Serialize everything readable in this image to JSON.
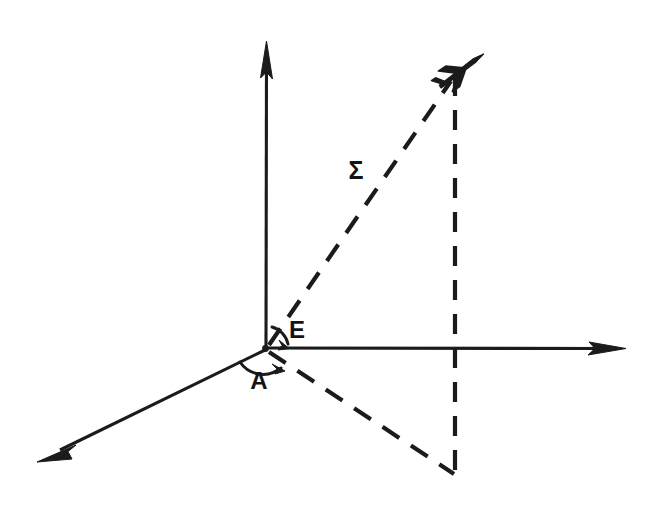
{
  "diagram": {
    "background_color": "#ffffff",
    "ink_color": "#1b1b1b",
    "canvas": {
      "width": 661,
      "height": 509
    },
    "origin": {
      "x": 265,
      "y": 349,
      "label": "origin"
    },
    "labels": {
      "range": "Σ",
      "elevation": "E",
      "azimuth": "A"
    },
    "label_positions": {
      "range": {
        "x": 356,
        "y": 172
      },
      "elevation": {
        "x": 297,
        "y": 332
      },
      "azimuth": {
        "x": 259,
        "y": 383
      }
    },
    "axes": [
      {
        "name": "vertical-axis",
        "description": "upward vertical axis with solid arrowhead",
        "from": {
          "x": 266,
          "y": 349
        },
        "to": {
          "x": 267,
          "y": 48
        },
        "style": "solid",
        "arrow": true
      },
      {
        "name": "horizontal-axis",
        "description": "rightward horizontal axis with solid arrowhead",
        "from": {
          "x": 265,
          "y": 348
        },
        "to": {
          "x": 618,
          "y": 348
        },
        "style": "solid",
        "arrow": true
      },
      {
        "name": "depth-axis",
        "description": "axis toward viewer, down-left with solid arrowhead",
        "from": {
          "x": 265,
          "y": 350
        },
        "to": {
          "x": 48,
          "y": 456
        },
        "style": "solid",
        "arrow": true
      }
    ],
    "construction_lines": [
      {
        "name": "range-line",
        "description": "dashed slant range line from origin to target",
        "from": {
          "x": 268,
          "y": 346
        },
        "to": {
          "x": 452,
          "y": 79
        },
        "style": "dashed",
        "label": "Σ"
      },
      {
        "name": "ground-track-line",
        "description": "dashed ground projection from origin to base point",
        "from": {
          "x": 268,
          "y": 352
        },
        "to": {
          "x": 455,
          "y": 475
        },
        "style": "dashed"
      },
      {
        "name": "altitude-line",
        "description": "dashed vertical drop line from target through horizontal plane to base point",
        "from": {
          "x": 455,
          "y": 76
        },
        "to": {
          "x": 455,
          "y": 477
        },
        "style": "dashed"
      }
    ],
    "angles": [
      {
        "name": "elevation-angle-arc",
        "label": "E",
        "description": "arc between horizontal axis and range line above the plane",
        "radius": 22
      },
      {
        "name": "azimuth-angle-arc",
        "label": "A",
        "description": "arc between depth axis and ground track below the plane",
        "radius": 26
      }
    ],
    "target": {
      "name": "aircraft-symbol",
      "description": "small aircraft silhouette marking the target position",
      "x": 461,
      "y": 69
    }
  }
}
